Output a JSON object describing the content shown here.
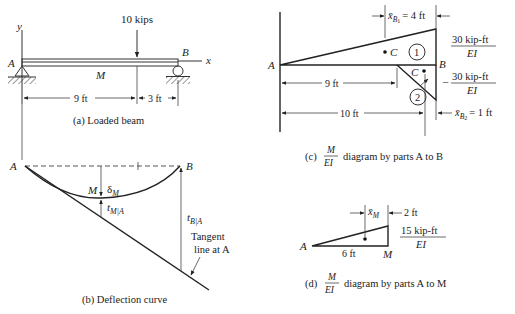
{
  "figure": {
    "panel_a": {
      "caption": "(a)  Loaded beam",
      "load_label": "10 kips",
      "axis_y": "y",
      "axis_x": "x",
      "point_a": "A",
      "point_b": "B",
      "point_m": "M",
      "dim_left": "9 ft",
      "dim_right": "3 ft"
    },
    "panel_b": {
      "caption": "(b)  Deflection curve",
      "point_a": "A",
      "point_b": "B",
      "point_m": "M",
      "delta_label": "δ",
      "delta_sub": "M",
      "t_ma_label": "t",
      "t_ma_sub": "M|A",
      "t_ba_label": "t",
      "t_ba_sub": "B|A",
      "tangent_line_1": "Tangent",
      "tangent_line_2": "line at A"
    },
    "panel_c": {
      "caption_prefix": "(c)",
      "caption_num": "M",
      "caption_den": "EI",
      "caption_suffix": "diagram by parts A to B",
      "point_a": "A",
      "point_b": "B",
      "centroid_1": "C",
      "centroid_2": "C",
      "part_1": "1",
      "part_2": "2",
      "xb1_label": "x̄",
      "xb1_sub": "B",
      "xb1_subsub": "1",
      "xb1_value": "= 4 ft",
      "xb2_label": "x̄",
      "xb2_sub": "B",
      "xb2_subsub": "2",
      "xb2_value": "= 1 ft",
      "dim_9": "9 ft",
      "dim_10": "10 ft",
      "moment_pos_num": "30 kip-ft",
      "moment_pos_den": "EI",
      "moment_neg_sign": "–",
      "moment_neg_num": "30 kip-ft",
      "moment_neg_den": "EI"
    },
    "panel_d": {
      "caption_prefix": "(d)",
      "caption_num": "M",
      "caption_den": "EI",
      "caption_suffix": "diagram by parts A to M",
      "point_a": "A",
      "point_m": "M",
      "dim_6": "6 ft",
      "xm_label": "x̄",
      "xm_sub": "M",
      "dim_2": "2 ft",
      "moment_num": "15 kip-ft",
      "moment_den": "EI"
    }
  }
}
